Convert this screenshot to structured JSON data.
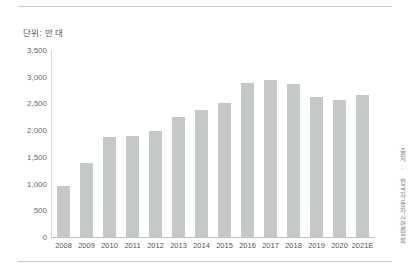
{
  "unit_label": "단위: 만 대",
  "source_credit": "출처: 한국자동차산업협회",
  "colors": {
    "bar": "#c5c8c9",
    "axis": "#c4c4c4",
    "rule": "#c9c9c9",
    "tick_text": "#6a6a6a",
    "label_text": "#555555",
    "credit_text": "#8a8a8a",
    "background": "#ffffff"
  },
  "chart_data": {
    "type": "bar",
    "title": "",
    "subtitle": "",
    "xlabel": "",
    "ylabel": "",
    "unit_note": "단위: 만 대",
    "source": "출처: 한국자동차산업협회",
    "grid": false,
    "legend": "none",
    "ylim": [
      0,
      3500
    ],
    "yticks": [
      0,
      500,
      1000,
      1500,
      2000,
      2500,
      3000,
      3500
    ],
    "ytick_labels": [
      "0",
      "500",
      "1,000",
      "1,500",
      "2,000",
      "2,500",
      "3,000",
      "3,500"
    ],
    "categories": [
      "2008",
      "2009",
      "2010",
      "2011",
      "2012",
      "2013",
      "2014",
      "2015",
      "2016",
      "2017",
      "2018",
      "2019",
      "2020",
      "2021E"
    ],
    "values": [
      950,
      1380,
      1870,
      1890,
      1980,
      2240,
      2370,
      2510,
      2880,
      2940,
      2860,
      2620,
      2570,
      2660
    ]
  }
}
